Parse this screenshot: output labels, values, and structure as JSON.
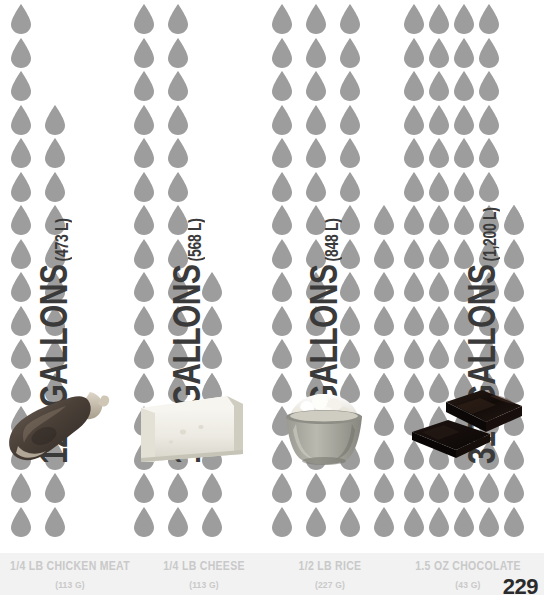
{
  "infographic": {
    "title": "Water footprint of foods",
    "droplet_color": "#9d9d9d",
    "caption_band_color": "#f2f2f2",
    "page_number": "229"
  },
  "chart_data": {
    "type": "bar",
    "xlabel": "",
    "ylabel": "Gallons of water",
    "unit_glyph": "water-droplet",
    "categories": [
      "1/4 LB CHICKEN MEAT",
      "1/4 LB CHEESE",
      "1/2 LB RICE",
      "1.5 OZ CHOCOLATE"
    ],
    "values": [
      125,
      150,
      224,
      317
    ],
    "values_liters": [
      473,
      568,
      848,
      1200
    ],
    "value_labels": [
      "125 GALLONS",
      "150 GALLONS",
      "224 GALLONS",
      "317 GALLONS"
    ],
    "liter_labels": [
      "(473 L)",
      "(568 L)",
      "(848 L)",
      "(1,200 L)"
    ],
    "weights": [
      "(113 G)",
      "(113 G)",
      "(227 G)",
      "(43 G)"
    ],
    "droplet_counts": [
      29,
      35,
      52,
      74
    ],
    "grid": false,
    "legend": "none"
  },
  "columns": [
    {
      "id": "chicken",
      "value_label": "125 GALLONS",
      "liter_label": "(473 L)",
      "name": "1/4 LB CHICKEN MEAT",
      "grams": "(113 G)",
      "photo": "chicken-drumstick"
    },
    {
      "id": "cheese",
      "value_label": "150 GALLONS",
      "liter_label": "(568 L)",
      "name": "1/4 LB CHEESE",
      "grams": "(113 G)",
      "photo": "cheese-block"
    },
    {
      "id": "rice",
      "value_label": "224 GALLONS",
      "liter_label": "(848 L)",
      "name": "1/2 LB RICE",
      "grams": "(227 G)",
      "photo": "rice-bowl"
    },
    {
      "id": "chocolate",
      "value_label": "317 GALLONS",
      "liter_label": "(1,200 L)",
      "name": "1.5 OZ CHOCOLATE",
      "grams": "(43 G)",
      "photo": "chocolate-squares"
    }
  ]
}
